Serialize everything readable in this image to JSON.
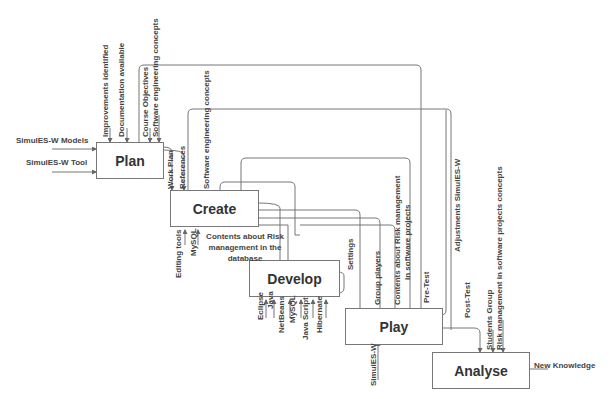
{
  "boxes": {
    "plan": "Plan",
    "create": "Create",
    "develop": "Develop",
    "play": "Play",
    "analyse": "Analyse"
  },
  "plan_inputs": {
    "models": "SimulES-W Models",
    "tool": "SimulES-W Tool"
  },
  "plan_controls": {
    "improvements": "Improvements identified",
    "documentation": "Documentation available",
    "objectives": "Course Objectives",
    "sw_concepts": "Software engineering concepts"
  },
  "create_controls": {
    "work_plan": "Work Plan",
    "references": "References",
    "sw_concepts": "Software engineering concepts"
  },
  "create_mechanisms": {
    "editing_tools": "Editing tools",
    "mysql": "MySQL"
  },
  "create_output": {
    "contents_db": "Contents about Risk management in the database"
  },
  "develop_labels": {
    "settings": "Settings"
  },
  "develop_mechanisms": [
    "Eclipse",
    "Java",
    "NetBeans",
    "MySQL",
    "Java Script",
    "Hibernate"
  ],
  "play_controls": {
    "group_players": "Group players",
    "contents_risk": "Contents about Risk management",
    "contents_risk_2": "in software projects",
    "pre_test": "Pre-Test"
  },
  "play_mechanism": "SimulES-W",
  "adjustments": "Adjustments SimulES-W",
  "post_test": "Post-Test",
  "analyse_controls": {
    "students_group": "Students Group",
    "risk_concepts": "Risk management in software projects concepts"
  },
  "analyse_output": "New Knowledge"
}
